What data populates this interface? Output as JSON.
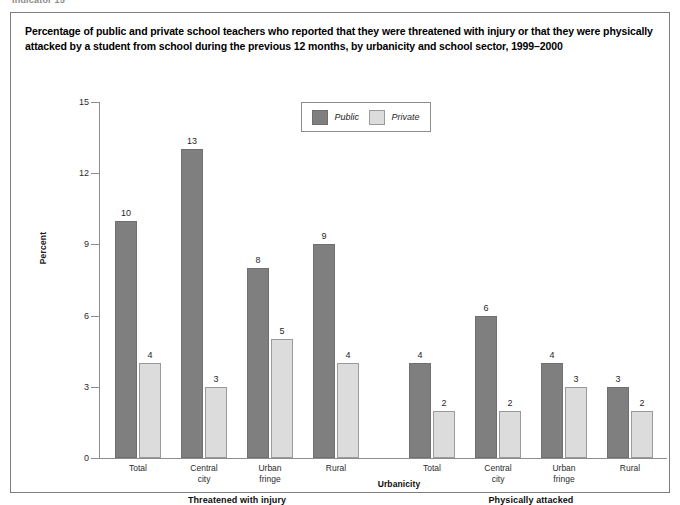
{
  "running_head": "Indicator 15",
  "figure": {
    "title": "Percentage of public and private school teachers who reported that they were threatened with injury or that they were physically attacked by a student from school during the previous 12 months, by urbanicity and school sector, 1999–2000"
  },
  "legend": {
    "items": [
      {
        "label": "Public",
        "color": "#7f7f7f"
      },
      {
        "label": "Private",
        "color": "#dcdcdc"
      }
    ]
  },
  "chart_data": {
    "type": "bar",
    "title": "Percentage of public and private school teachers who reported that they were threatened with injury or that they were physically attacked by a student from school during the previous 12 months, by urbanicity and school sector, 1999–2000",
    "xlabel": "Urbanicity",
    "ylabel": "Percent",
    "ylim": [
      0,
      15
    ],
    "yticks": [
      0,
      3,
      6,
      9,
      12,
      15
    ],
    "ytick_labels": [
      "0",
      "3",
      "6",
      "9",
      "12",
      "15"
    ],
    "grid": false,
    "legend_position": "top-center",
    "group_labels": [
      "Threatened with injury",
      "Physically attacked"
    ],
    "categories": [
      "Total",
      "Central city",
      "Urban fringe",
      "Rural"
    ],
    "category_label_lines": [
      [
        "Total"
      ],
      [
        "Central",
        "city"
      ],
      [
        "Urban",
        "fringe"
      ],
      [
        "Rural"
      ]
    ],
    "groups": [
      {
        "name": "Threatened with injury",
        "series": [
          {
            "name": "Public",
            "values": [
              10,
              13,
              8,
              9
            ]
          },
          {
            "name": "Private",
            "values": [
              4,
              3,
              5,
              4
            ]
          }
        ]
      },
      {
        "name": "Physically attacked",
        "series": [
          {
            "name": "Public",
            "values": [
              4,
              6,
              4,
              3
            ]
          },
          {
            "name": "Private",
            "values": [
              2,
              2,
              3,
              2
            ]
          }
        ]
      }
    ],
    "bar_labels": {
      "threatened_public": [
        "10",
        "13",
        "8",
        "9"
      ],
      "threatened_private": [
        "4",
        "3",
        "5",
        "4"
      ],
      "attacked_public": [
        "4",
        "6",
        "4",
        "3"
      ],
      "attacked_private": [
        "2",
        "2",
        "3",
        "2"
      ]
    }
  }
}
